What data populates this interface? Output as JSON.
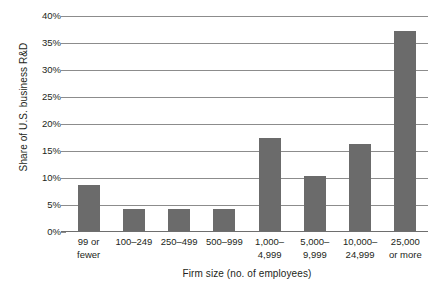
{
  "chart_data": {
    "type": "bar",
    "title": "",
    "xlabel": "Firm size (no. of employees)",
    "ylabel": "Share of U.S. business R&D",
    "categories": [
      "99 or\nfewer",
      "100–249",
      "250–499",
      "500–999",
      "1,000–\n4,999",
      "5,000–\n9,999",
      "10,000–\n24,999",
      "25,000\nor more"
    ],
    "values": [
      8.5,
      4.0,
      4.0,
      4.0,
      17.2,
      10.2,
      16.2,
      37.0
    ],
    "ylim": [
      0,
      40
    ],
    "yticks": [
      0,
      5,
      10,
      15,
      20,
      25,
      30,
      35,
      40
    ],
    "ytick_labels": [
      "0%",
      "5%",
      "10%",
      "15%",
      "20%",
      "25%",
      "30%",
      "35%",
      "40%"
    ],
    "grid": true,
    "legend": false,
    "bar_color": "#6b6b6b",
    "gridline_color": "#8c8c8c",
    "axis_color": "#6e6e6e",
    "text_color": "#231f20",
    "background": "#ffffff"
  }
}
